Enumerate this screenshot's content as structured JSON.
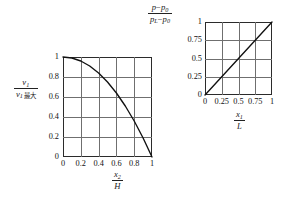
{
  "figure": {
    "name": "velocity-and-pressure-profiles",
    "background": "#ffffff",
    "axis_color": "#2b2b2b",
    "grid_color": "#6f6f6f",
    "curve_color": "#111111"
  },
  "left_chart": {
    "ylabel": {
      "numerator_var": "v",
      "numerator_sub": "1",
      "denominator_var": "v",
      "denominator_sub": "1",
      "denominator_suffix": "最大"
    },
    "xlabel": {
      "numerator_var": "x",
      "numerator_sub": "2",
      "denominator_var": "H"
    },
    "xticks": [
      "0",
      "0.2",
      "0.4",
      "0.6",
      "0.8",
      "1"
    ],
    "yticks": [
      "0",
      "0.2",
      "0.4",
      "0.6",
      "0.8",
      "1"
    ]
  },
  "right_chart": {
    "ylabel": {
      "num_p": "p",
      "num_minus": "−",
      "num_p0": "p",
      "num_p0_sub": "0",
      "den_pL": "p",
      "den_pL_sub": "L",
      "den_minus": "−",
      "den_p0": "p",
      "den_p0_sub": "0"
    },
    "xlabel": {
      "numerator_var": "x",
      "numerator_sub": "1",
      "denominator_var": "L"
    },
    "xticks": [
      "0",
      "0.25",
      "0.5",
      "0.75",
      "1"
    ],
    "yticks": [
      "0",
      "0.25",
      "0.5",
      "0.75",
      "1"
    ]
  },
  "chart_data": [
    {
      "type": "line",
      "name": "velocity-profile",
      "title": "",
      "xlabel": "x2/H",
      "ylabel": "v1/v1,max",
      "xlim": [
        0,
        1
      ],
      "ylim": [
        0,
        1
      ],
      "xticks": [
        0,
        0.2,
        0.4,
        0.6,
        0.8,
        1
      ],
      "yticks": [
        0,
        0.2,
        0.4,
        0.6,
        0.8,
        1
      ],
      "grid": true,
      "legend": "none",
      "annotation": "Parabolic velocity profile: y = 1 - x^2",
      "x": [
        0,
        0.1,
        0.2,
        0.3,
        0.4,
        0.5,
        0.6,
        0.7,
        0.8,
        0.9,
        1
      ],
      "y": [
        1,
        0.99,
        0.96,
        0.91,
        0.84,
        0.75,
        0.64,
        0.51,
        0.36,
        0.19,
        0
      ]
    },
    {
      "type": "line",
      "name": "pressure-profile",
      "title": "",
      "xlabel": "x1/L",
      "ylabel": "(p-p0)/(pL-p0)",
      "xlim": [
        0,
        1
      ],
      "ylim": [
        0,
        1
      ],
      "xticks": [
        0,
        0.25,
        0.5,
        0.75,
        1
      ],
      "yticks": [
        0,
        0.25,
        0.5,
        0.75,
        1
      ],
      "grid": true,
      "legend": "none",
      "annotation": "Linear pressure drop: y = x",
      "x": [
        0,
        0.25,
        0.5,
        0.75,
        1
      ],
      "y": [
        0,
        0.25,
        0.5,
        0.75,
        1
      ]
    }
  ]
}
